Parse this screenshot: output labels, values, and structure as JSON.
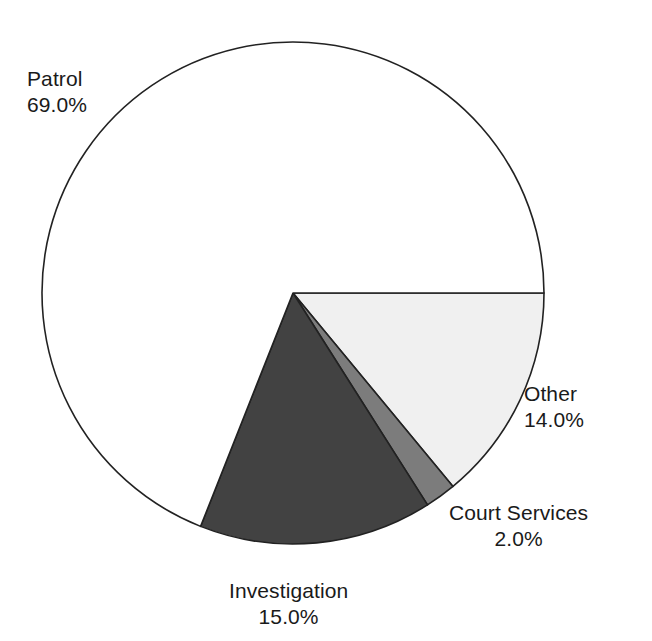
{
  "chart_data": {
    "type": "pie",
    "title": "",
    "subtitle": "",
    "xlabel": "",
    "ylabel": "",
    "legend_position": "none",
    "grid": false,
    "labels_outside": true,
    "start_angle_deg": 0,
    "direction": "clockwise",
    "categories": [
      "Other",
      "Court Services",
      "Investigation",
      "Patrol"
    ],
    "values": [
      14.0,
      15.0,
      2.0,
      69.0
    ],
    "slices": [
      {
        "name": "Other",
        "value": 14.0,
        "value_label": "14.0%",
        "color": "#f0f0f0",
        "stroke": "#222222"
      },
      {
        "name": "Court Services",
        "value": 2.0,
        "value_label": "2.0%",
        "color": "#7c7c7c",
        "stroke": "#222222"
      },
      {
        "name": "Investigation",
        "value": 15.0,
        "value_label": "15.0%",
        "color": "#424242",
        "stroke": "#222222"
      },
      {
        "name": "Patrol",
        "value": 69.0,
        "value_label": "69.0%",
        "color": "#ffffff",
        "stroke": "#222222"
      }
    ]
  },
  "labels": {
    "patrol": {
      "name": "Patrol",
      "value": "69.0%"
    },
    "other": {
      "name": "Other",
      "value": "14.0%"
    },
    "court_services": {
      "name": "Court Services",
      "value": "2.0%"
    },
    "investigation": {
      "name": "Investigation",
      "value": "15.0%"
    }
  },
  "geometry": {
    "center_x": 293,
    "center_y": 293,
    "radius": 251
  },
  "colors": {
    "background": "#ffffff",
    "outline": "#222222",
    "text": "#1a1a1a"
  }
}
